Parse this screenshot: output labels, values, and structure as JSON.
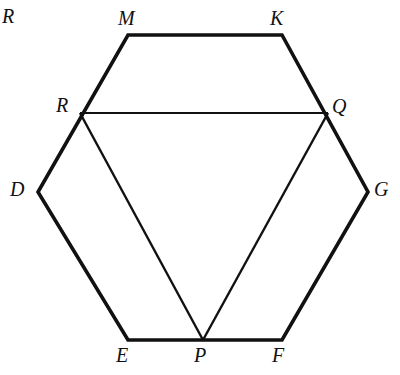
{
  "figure": {
    "background_color": "#ffffff",
    "stroke_color": "#111111",
    "width": 400,
    "height": 375,
    "outline_stroke_width": 3.6,
    "inner_stroke_width": 2.0
  },
  "points": {
    "M": {
      "label": "M",
      "x": 128,
      "y": 35
    },
    "K": {
      "label": "K",
      "x": 282,
      "y": 35
    },
    "G": {
      "label": "G",
      "x": 368,
      "y": 192
    },
    "F": {
      "label": "F",
      "x": 282,
      "y": 340
    },
    "P": {
      "label": "P",
      "x": 203,
      "y": 340
    },
    "E": {
      "label": "E",
      "x": 128,
      "y": 340
    },
    "D": {
      "label": "D",
      "x": 38,
      "y": 192
    },
    "R": {
      "label": "R",
      "x": 80,
      "y": 113
    },
    "Q": {
      "label": "Q",
      "x": 328,
      "y": 113
    }
  },
  "labels": [
    {
      "name": "label-corner-R",
      "text": "R",
      "x": 2,
      "y": 6,
      "size": 20
    },
    {
      "name": "label-M",
      "text": "M",
      "x": 118,
      "y": 8,
      "size": 20
    },
    {
      "name": "label-K",
      "text": "K",
      "x": 270,
      "y": 8,
      "size": 20
    },
    {
      "name": "label-R",
      "text": "R",
      "x": 56,
      "y": 95,
      "size": 20
    },
    {
      "name": "label-Q",
      "text": "Q",
      "x": 332,
      "y": 96,
      "size": 20
    },
    {
      "name": "label-D",
      "text": "D",
      "x": 10,
      "y": 179,
      "size": 20
    },
    {
      "name": "label-G",
      "text": "G",
      "x": 374,
      "y": 179,
      "size": 20
    },
    {
      "name": "label-E",
      "text": "E",
      "x": 116,
      "y": 345,
      "size": 20
    },
    {
      "name": "label-P",
      "text": "P",
      "x": 194,
      "y": 345,
      "size": 20
    },
    {
      "name": "label-F",
      "text": "F",
      "x": 272,
      "y": 345,
      "size": 20
    }
  ],
  "outline_path": "M 128 35 L 282 35 L 368 192 L 282 340 L 203 340 L 128 340 L 38 192 Z",
  "segments": [
    {
      "name": "segment-RQ",
      "from": "R",
      "to": "Q",
      "x1": 80,
      "y1": 113,
      "x2": 328,
      "y2": 113
    },
    {
      "name": "segment-RP",
      "from": "R",
      "to": "P",
      "x1": 80,
      "y1": 113,
      "x2": 203,
      "y2": 340
    },
    {
      "name": "segment-QP",
      "from": "Q",
      "to": "P",
      "x1": 328,
      "y1": 113,
      "x2": 203,
      "y2": 340
    }
  ]
}
